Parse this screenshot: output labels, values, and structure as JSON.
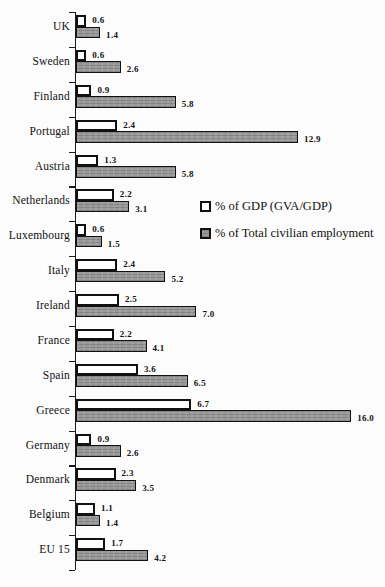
{
  "chart_data": {
    "type": "bar",
    "orientation": "horizontal",
    "title": "",
    "xlabel": "",
    "ylabel": "",
    "categories": [
      "UK",
      "Sweden",
      "Finland",
      "Portugal",
      "Austria",
      "Netherlands",
      "Luxembourg",
      "Italy",
      "Ireland",
      "France",
      "Spain",
      "Greece",
      "Germany",
      "Denmark",
      "Belgium",
      "EU 15"
    ],
    "series": [
      {
        "name": "% of GDP (GVA/GDP)",
        "fill": "#ffffff",
        "values": [
          0.6,
          0.6,
          0.9,
          2.4,
          1.3,
          2.2,
          0.6,
          2.4,
          2.5,
          2.2,
          3.6,
          6.7,
          0.9,
          2.3,
          1.1,
          1.7
        ]
      },
      {
        "name": "% of Total civilian employment",
        "fill": "#999999",
        "values": [
          1.4,
          2.6,
          5.8,
          12.9,
          5.8,
          3.1,
          1.5,
          5.2,
          7.0,
          4.1,
          6.5,
          16.0,
          2.6,
          3.5,
          1.4,
          4.2
        ]
      }
    ],
    "xlim": [
      0,
      16.5
    ],
    "grid": false,
    "legend_position": "center-right",
    "value_labels": true
  },
  "colors": {
    "ink": "#111111",
    "bar_border": "#111111",
    "gdp_fill": "#ffffff",
    "employment_fill": "#999999",
    "background": "#fcfcfc"
  }
}
